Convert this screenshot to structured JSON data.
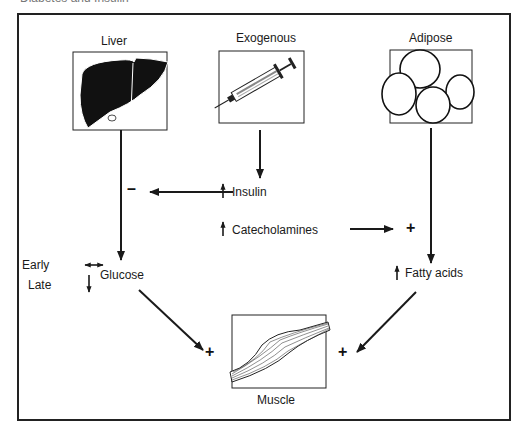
{
  "caption": "Diabetes and Insulin",
  "sources": {
    "liver": {
      "label": "Liver",
      "icon": "liver-icon"
    },
    "exogenous": {
      "label": "Exogenous",
      "icon": "syringe-icon"
    },
    "adipose": {
      "label": "Adipose",
      "icon": "adipose-cells-icon"
    }
  },
  "middle": {
    "insulin": "Insulin",
    "catecholamines": "Catecholamines",
    "insulin_effect": "–",
    "catecholamine_effect": "+"
  },
  "glucose": {
    "label": "Glucose",
    "early": "Early",
    "late": "Late"
  },
  "fatty_acids": {
    "label": "Fatty acids"
  },
  "target": {
    "label": "Muscle",
    "icon": "muscle-icon",
    "glucose_effect": "+",
    "fatty_acid_effect": "+"
  },
  "colors": {
    "line": "#1a1a1a",
    "background": "#ffffff"
  }
}
